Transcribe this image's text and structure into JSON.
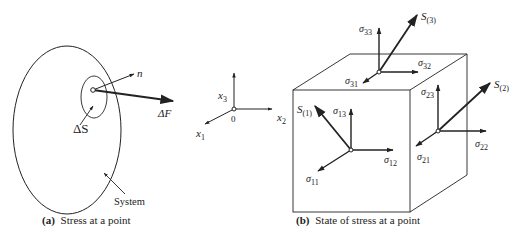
{
  "figure_a": {
    "caption_prefix": "(a)",
    "caption_text": "Stress at a point",
    "labels": {
      "normal": "n",
      "force": "ΔF",
      "area": "ΔS",
      "system": "System"
    }
  },
  "axes": {
    "x1": "x",
    "x1_sub": "1",
    "x2": "x",
    "x2_sub": "2",
    "x3": "x",
    "x3_sub": "3",
    "origin": "0"
  },
  "figure_b": {
    "caption_prefix": "(b)",
    "caption_text": "State of stress at a point",
    "top_face": {
      "traction": "S",
      "traction_sub": "(3)",
      "normal_stress": "σ",
      "normal_stress_sub": "33",
      "shear_a": "σ",
      "shear_a_sub": "31",
      "shear_b": "σ",
      "shear_b_sub": "32"
    },
    "front_face": {
      "traction": "S",
      "traction_sub": "(1)",
      "normal_stress": "σ",
      "normal_stress_sub": "11",
      "shear_a": "σ",
      "shear_a_sub": "12",
      "shear_b": "σ",
      "shear_b_sub": "13"
    },
    "right_face": {
      "traction": "S",
      "traction_sub": "(2)",
      "normal_stress": "σ",
      "normal_stress_sub": "22",
      "shear_a": "σ",
      "shear_a_sub": "21",
      "shear_b": "σ",
      "shear_b_sub": "23"
    }
  },
  "colors": {
    "ink": "#222222",
    "background": "#ffffff"
  }
}
